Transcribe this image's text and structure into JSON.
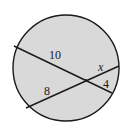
{
  "diagram": {
    "colors": {
      "fill": "#d9d9d9",
      "stroke": "#1a1a1a",
      "background": "#ffffff"
    },
    "chords": [
      {
        "name": "chord-a",
        "segments": [
          "10",
          "4"
        ]
      },
      {
        "name": "chord-b",
        "segments": [
          "8",
          "x"
        ]
      }
    ],
    "labels": {
      "upper_left_segment": "10",
      "lower_right_segment": "4",
      "lower_left_segment": "8",
      "upper_right_segment": "x"
    }
  }
}
